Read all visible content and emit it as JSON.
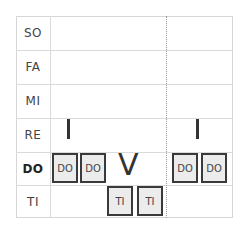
{
  "rows": [
    {
      "label": "SO",
      "bold": false
    },
    {
      "label": "FA",
      "bold": false
    },
    {
      "label": "MI",
      "bold": false
    },
    {
      "label": "RE",
      "bold": false
    },
    {
      "label": "DO",
      "bold": true
    },
    {
      "label": "TI",
      "bold": false
    }
  ],
  "notes": [
    {
      "label": "DO",
      "row": "DO"
    },
    {
      "label": "DO",
      "row": "DO"
    },
    {
      "label": "TI",
      "row": "TI"
    },
    {
      "label": "TI",
      "row": "TI"
    },
    {
      "label": "DO",
      "row": "DO"
    },
    {
      "label": "DO",
      "row": "DO"
    }
  ],
  "chord_symbols": [
    {
      "symbol": "I",
      "position": "first"
    },
    {
      "symbol": "V",
      "position": "middle"
    },
    {
      "symbol": "I",
      "position": "last"
    }
  ],
  "colors": {
    "note_fill": "#ececec",
    "note_border": "#3a3a3a",
    "grid_line": "#dadada"
  }
}
